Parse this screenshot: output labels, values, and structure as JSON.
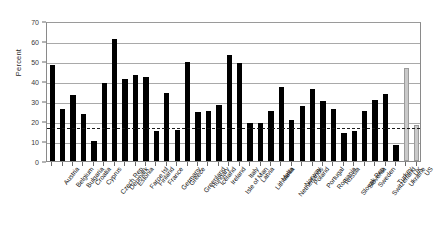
{
  "chart_data": {
    "type": "bar",
    "title": "",
    "xlabel": "",
    "ylabel": "Percent",
    "ylim": [
      0,
      70
    ],
    "ytick_step": 10,
    "ytick_labels": [
      "0",
      "10",
      "20",
      "30",
      "40",
      "50",
      "60",
      "70"
    ],
    "grid": true,
    "legend": "none",
    "reference_line": {
      "value": 17.5,
      "style": "dashed",
      "color": "#1a1a1a"
    },
    "categories": [
      "Austria",
      "Belgium",
      "Bulgaria",
      "Croatia",
      "Cyprus",
      "Czech Rep",
      "Denmark",
      "Estonia",
      "Faroe Isl",
      "Finland",
      "France",
      "Germany",
      "Greece",
      "Greenland",
      "Hungary",
      "Iceland",
      "Ireland",
      "Isle of Man",
      "Italy",
      "Latvia",
      "Lithuania",
      "Malta",
      "Netherlands",
      "Norway",
      "Poland",
      "Portugal",
      "Romania",
      "Russia",
      "Slovak Rep",
      "Slovenia",
      "Sweden",
      "Switzerland",
      "Turkey",
      "Ukraine",
      "UK",
      "US"
    ],
    "values": [
      48,
      26,
      33,
      23.5,
      10,
      39,
      61,
      41,
      43,
      42,
      15,
      34,
      15.5,
      49.5,
      24.5,
      25,
      28,
      53,
      49,
      19,
      19,
      25,
      37,
      20.5,
      27.5,
      36,
      30,
      26,
      14,
      15,
      25,
      30.5,
      33.5,
      8,
      46.5,
      18
    ],
    "bar_styles": [
      "black",
      "black",
      "black",
      "black",
      "black",
      "black",
      "black",
      "black",
      "black",
      "black",
      "black",
      "black",
      "black",
      "black",
      "black",
      "black",
      "black",
      "black",
      "black",
      "black",
      "black",
      "black",
      "black",
      "black",
      "black",
      "black",
      "black",
      "black",
      "black",
      "black",
      "black",
      "black",
      "black",
      "black",
      "light",
      "light"
    ],
    "colors": {
      "bar_primary": "#000000",
      "bar_secondary": "#c9c9c9",
      "gridline": "#a9a9a9",
      "axis": "#8a8a8a",
      "reference": "#1a1a1a"
    }
  }
}
